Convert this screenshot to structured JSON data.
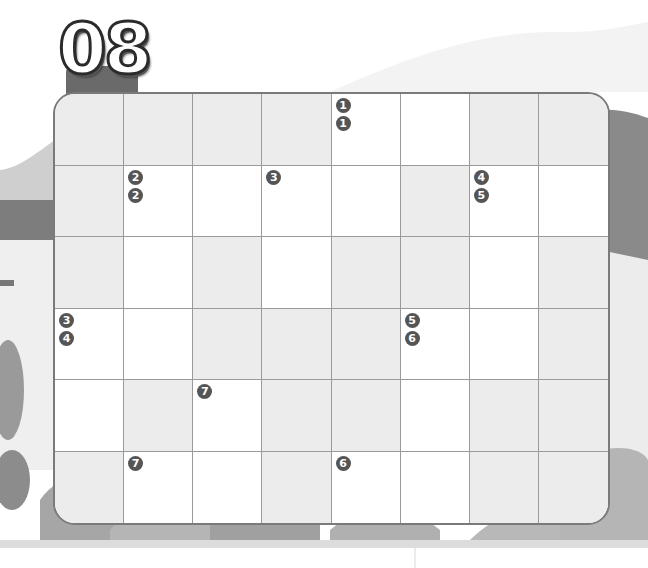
{
  "title": {
    "number": "08"
  },
  "colors": {
    "board_border": "#7a7a7a",
    "shaded_cell": "#ececec",
    "white_cell": "#ffffff",
    "grid_line": "#9a9a9a",
    "clue_badge": "#555555",
    "title_tab": "#6a6a6a"
  },
  "grid": {
    "columns": 8,
    "rows": 6,
    "cells": [
      [
        {
          "type": "shaded",
          "clues": []
        },
        {
          "type": "shaded",
          "clues": []
        },
        {
          "type": "shaded",
          "clues": []
        },
        {
          "type": "shaded",
          "clues": []
        },
        {
          "type": "white",
          "clues": [
            "1",
            "1"
          ]
        },
        {
          "type": "white",
          "clues": []
        },
        {
          "type": "shaded",
          "clues": []
        },
        {
          "type": "shaded",
          "clues": []
        }
      ],
      [
        {
          "type": "shaded",
          "clues": []
        },
        {
          "type": "white",
          "clues": [
            "2",
            "2"
          ]
        },
        {
          "type": "white",
          "clues": []
        },
        {
          "type": "white",
          "clues": [
            "3"
          ]
        },
        {
          "type": "white",
          "clues": []
        },
        {
          "type": "shaded",
          "clues": []
        },
        {
          "type": "white",
          "clues": [
            "4",
            "5"
          ]
        },
        {
          "type": "white",
          "clues": []
        }
      ],
      [
        {
          "type": "shaded",
          "clues": []
        },
        {
          "type": "white",
          "clues": []
        },
        {
          "type": "shaded",
          "clues": []
        },
        {
          "type": "white",
          "clues": []
        },
        {
          "type": "shaded",
          "clues": []
        },
        {
          "type": "shaded",
          "clues": []
        },
        {
          "type": "white",
          "clues": []
        },
        {
          "type": "shaded",
          "clues": []
        }
      ],
      [
        {
          "type": "white",
          "clues": [
            "3",
            "4"
          ]
        },
        {
          "type": "white",
          "clues": []
        },
        {
          "type": "shaded",
          "clues": []
        },
        {
          "type": "shaded",
          "clues": []
        },
        {
          "type": "shaded",
          "clues": []
        },
        {
          "type": "white",
          "clues": [
            "5",
            "6"
          ]
        },
        {
          "type": "white",
          "clues": []
        },
        {
          "type": "shaded",
          "clues": []
        }
      ],
      [
        {
          "type": "white",
          "clues": []
        },
        {
          "type": "shaded",
          "clues": []
        },
        {
          "type": "white",
          "clues": [
            "7"
          ]
        },
        {
          "type": "shaded",
          "clues": []
        },
        {
          "type": "shaded",
          "clues": []
        },
        {
          "type": "white",
          "clues": []
        },
        {
          "type": "shaded",
          "clues": []
        },
        {
          "type": "shaded",
          "clues": []
        }
      ],
      [
        {
          "type": "shaded",
          "clues": []
        },
        {
          "type": "white",
          "clues": [
            "7"
          ]
        },
        {
          "type": "white",
          "clues": []
        },
        {
          "type": "shaded",
          "clues": []
        },
        {
          "type": "white",
          "clues": [
            "6"
          ]
        },
        {
          "type": "white",
          "clues": []
        },
        {
          "type": "shaded",
          "clues": []
        },
        {
          "type": "shaded",
          "clues": []
        }
      ]
    ]
  }
}
